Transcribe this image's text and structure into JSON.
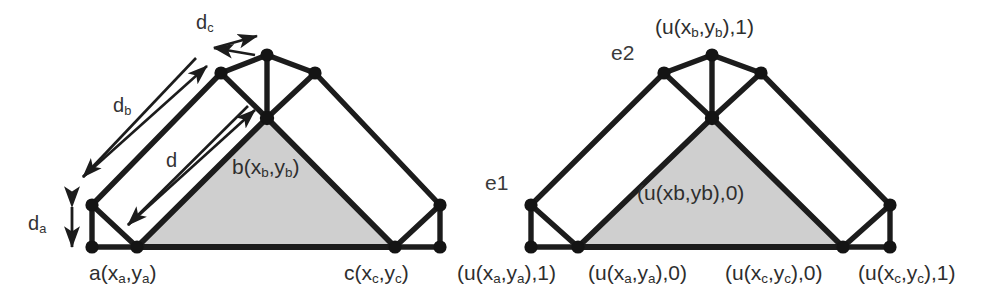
{
  "figure": {
    "caption": "",
    "colors": {
      "background": "#ffffff",
      "edge": "#1c1c1c",
      "node": "#141414",
      "shaded_triangle": "#cfcfcf",
      "text": "#333333"
    }
  },
  "left_diagram": {
    "name": "distance-annotated-triangle-graph",
    "labels": {
      "d_c": {
        "base": "d",
        "sub": "c"
      },
      "d_b": {
        "base": "d",
        "sub": "b"
      },
      "d": {
        "base": "d",
        "sub": ""
      },
      "d_a": {
        "base": "d",
        "sub": "a"
      },
      "vertex_b": {
        "prefix": "b(x",
        "sub1": "b",
        "mid": ",y",
        "sub2": "b",
        "suffix": ")"
      },
      "vertex_a": {
        "prefix": "a(x",
        "sub1": "a",
        "mid": ",y",
        "sub2": "a",
        "suffix": ")"
      },
      "vertex_c": {
        "prefix": "c(x",
        "sub1": "c",
        "mid": ",y",
        "sub2": "c",
        "suffix": ")"
      }
    },
    "arrows": [
      {
        "name": "arrow-dc",
        "label": "d_c",
        "double_headed": true
      },
      {
        "name": "arrow-db",
        "label": "d_b",
        "double_headed": true
      },
      {
        "name": "arrow-d",
        "label": "d",
        "double_headed": true
      },
      {
        "name": "arrow-da",
        "label": "d_a",
        "double_headed": true
      }
    ]
  },
  "right_diagram": {
    "name": "u-labeled-triangle-graph",
    "labels": {
      "top": {
        "prefix": "(u(x",
        "sub1": "b",
        "mid": ",y",
        "sub2": "b",
        "suffix": "),1)"
      },
      "e2": "e2",
      "e1": "e1",
      "inner": "(u(xb,yb),0)",
      "bottom_1": {
        "prefix": "(u(x",
        "sub1": "a",
        "mid": ",y",
        "sub2": "a",
        "suffix": "),1)"
      },
      "bottom_2": {
        "prefix": "(u(x",
        "sub1": "a",
        "mid": ",y",
        "sub2": "a",
        "suffix": "),0)"
      },
      "bottom_3": {
        "prefix": "(u(x",
        "sub1": "c",
        "mid": ",y",
        "sub2": "c",
        "suffix": "),0)"
      },
      "bottom_4": {
        "prefix": "(u(x",
        "sub1": "c",
        "mid": ",y",
        "sub2": "c",
        "suffix": "),1)"
      }
    }
  }
}
